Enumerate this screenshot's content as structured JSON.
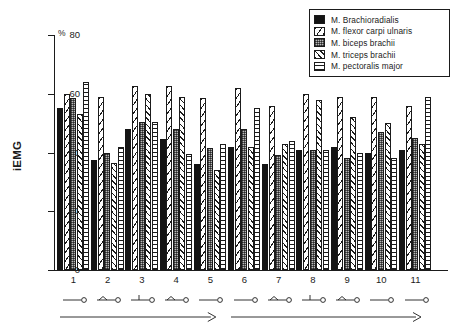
{
  "chart_data": {
    "type": "bar",
    "title": "",
    "subtitle": "",
    "xlabel": "",
    "ylabel": "iEMG",
    "yunit": "%",
    "ylim": [
      0,
      80
    ],
    "yticks": [
      0,
      20,
      40,
      60,
      80
    ],
    "grid": false,
    "legend_position": "top-right",
    "categories": [
      "1",
      "2",
      "3",
      "4",
      "5",
      "6",
      "7",
      "8",
      "9",
      "10",
      "11"
    ],
    "series": [
      {
        "name": "M. Brachioradialis",
        "pattern": "solid-black",
        "color": "#141414",
        "values": [
          55,
          37.5,
          48,
          44.5,
          36,
          42,
          36,
          41,
          42,
          40,
          41
        ]
      },
      {
        "name": "M. flexor carpi ulnaris",
        "pattern": "sparse-diagonal-hatch",
        "color": "#ffffff",
        "values": [
          60,
          59,
          62.5,
          62.5,
          58.5,
          62,
          56,
          60,
          59,
          59,
          56
        ]
      },
      {
        "name": "M. biceps brachii",
        "pattern": "stipple-grey",
        "color": "#b9b9b9",
        "values": [
          58.5,
          40,
          50.5,
          48,
          41.5,
          48,
          39,
          41,
          38,
          47,
          45
        ]
      },
      {
        "name": "M. triceps brachii",
        "pattern": "dense-diagonal-hatch",
        "color": "#ffffff",
        "values": [
          53,
          36.5,
          60,
          59,
          34,
          42,
          43,
          58,
          52,
          50,
          43
        ]
      },
      {
        "name": "M. pectoralis major",
        "pattern": "horizontal-hatch",
        "color": "#ffffff",
        "values": [
          64,
          42,
          50.5,
          39.5,
          43,
          55,
          44,
          41,
          40,
          38,
          59
        ]
      }
    ],
    "condition_icons": [
      "lever-horizontal-circle",
      "lever-peak-circle",
      "lever-tee-circle",
      "lever-peak-circle",
      "lever-horizontal-circle",
      "lever-horizontal-circle",
      "lever-peak-circle",
      "lever-tee-circle",
      "lever-peak-circle",
      "lever-horizontal-circle",
      "lever-horizontal-circle"
    ],
    "progression_arrows": [
      {
        "label": "",
        "spans": "1-5"
      },
      {
        "label": "",
        "spans": "6-11"
      }
    ],
    "axis_colors": {
      "axis": "#1b1b1b",
      "text": "#1b1b1b",
      "background": "#ffffff"
    }
  }
}
